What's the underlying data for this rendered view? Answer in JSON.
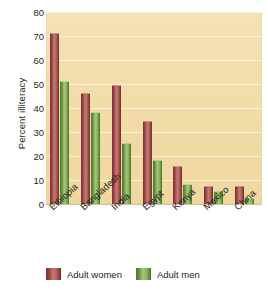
{
  "chart_data": {
    "type": "bar",
    "title": "",
    "subtitle": "",
    "xlabel": "",
    "ylabel": "Percent illiteracy",
    "ylim": [
      0,
      80
    ],
    "yticks": [
      80,
      70,
      60,
      50,
      40,
      30,
      20,
      10,
      0
    ],
    "ytick_labels": [
      "80",
      "70",
      "60",
      "50",
      "40",
      "30",
      "20",
      "10",
      "0"
    ],
    "grid": true,
    "legend_position": "bottom",
    "categories": [
      "Ethiopia",
      "Bangladesh",
      "India",
      "Egypt",
      "Kenya",
      "Mexico",
      "China"
    ],
    "series": [
      {
        "name": "Adult women",
        "color": "#9c4440",
        "values": [
          71,
          46,
          49,
          34,
          15.5,
          7,
          7
        ]
      },
      {
        "name": "Adult men",
        "color": "#6d9b3c",
        "values": [
          51,
          38,
          25,
          18,
          8,
          5,
          2
        ]
      }
    ],
    "plot_background_color": "#f2dca8",
    "gridline_color": "#ffffff",
    "text_color": "#231f20"
  },
  "legend": {
    "entries": [
      {
        "label": "Adult women",
        "swatch": "women"
      },
      {
        "label": "Adult men",
        "swatch": "men"
      }
    ]
  }
}
